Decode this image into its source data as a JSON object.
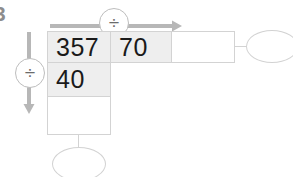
{
  "worksheet": {
    "problem_number": "3",
    "accent_color": "#b0b0b0",
    "grid_line_color": "#d3d3d3",
    "shaded_cell_color": "#eeeeee",
    "text_color": "#1a1a1a"
  },
  "arrows": {
    "top": {
      "direction": "right",
      "operator_symbol": "÷",
      "operator_name": "division",
      "icon": "arrow-right-icon"
    },
    "left": {
      "direction": "down",
      "operator_symbol": "÷",
      "operator_name": "division",
      "icon": "arrow-down-icon"
    }
  },
  "grid": {
    "rows": [
      {
        "cells": [
          {
            "value": "357",
            "shaded": true,
            "empty": false
          },
          {
            "value": "70",
            "shaded": true,
            "empty": false
          },
          {
            "value": "",
            "shaded": false,
            "empty": true
          }
        ]
      },
      {
        "cells": [
          {
            "value": "40",
            "shaded": true,
            "empty": false
          }
        ]
      },
      {
        "cells": [
          {
            "value": "",
            "shaded": false,
            "empty": true
          }
        ]
      }
    ]
  },
  "results": {
    "right_oval": {
      "value": "",
      "empty": true
    },
    "bottom_oval": {
      "value": "",
      "empty": true
    }
  }
}
